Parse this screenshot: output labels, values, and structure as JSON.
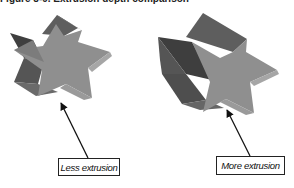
{
  "figure": {
    "caption": "Figure 8-9. Extrusion depth comparison",
    "panels": [
      {
        "id": "left",
        "label": "Less extrusion",
        "shape": "star-icon"
      },
      {
        "id": "right",
        "label": "More extrusion",
        "shape": "star-icon"
      }
    ],
    "colors": {
      "front_face": "#8f8f8f",
      "side_dark": "#4e4e4e",
      "side_mid": "#6a6a6a",
      "side_light": "#a6a6a6",
      "arrow": "#111111",
      "background": "#ffffff"
    }
  }
}
